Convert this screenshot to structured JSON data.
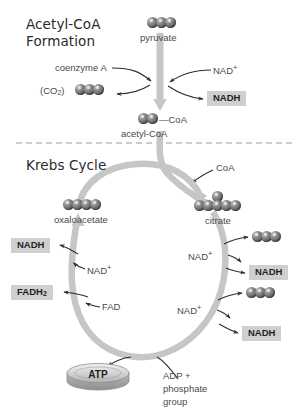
{
  "diagram": {
    "colors": {
      "arrow_gray": "#c4c4c4",
      "box_gray": "#cfcfcf",
      "sphere_gray": "#5e5e5e",
      "text_gray": "#4a4a4a",
      "heading_dark": "#2b2b2b",
      "divider_gray": "#9a9a9a",
      "background": "#ffffff"
    }
  },
  "sections": {
    "top": {
      "heading_line1": "Acetyl-CoA",
      "heading_line2": "Formation"
    },
    "bottom": {
      "heading": "Krebs Cycle"
    }
  },
  "acetyl_coa_formation": {
    "pyruvate": {
      "label": "pyruvate",
      "carbons": 3
    },
    "coenzyme_a": {
      "label": "coenzyme A"
    },
    "nad_plus": {
      "label": "NAD",
      "superscript": "+"
    },
    "nadh": {
      "label": "NADH"
    },
    "co2": {
      "label": "(CO",
      "subscript": "2",
      "label_end": ")",
      "carbons": 3
    },
    "acetyl_coa": {
      "label": "acetyl-CoA",
      "carbons": 2,
      "bond": "—",
      "coa_tag": "CoA"
    }
  },
  "krebs_cycle": {
    "coa_released": {
      "label": "CoA"
    },
    "oxaloacetate": {
      "label": "oxaloacetate",
      "carbons": 4
    },
    "citrate": {
      "label": "citrate",
      "carbons": 6
    },
    "left_reactions": [
      {
        "reactant": "NAD",
        "reactant_sup": "+",
        "product": "NADH"
      },
      {
        "reactant": "FAD",
        "reactant_sup": "",
        "product": "FADH",
        "product_sub": "2"
      }
    ],
    "right_reactions": [
      {
        "reactant": "NAD",
        "reactant_sup": "+",
        "product": "NADH",
        "co2_carbons": 3
      },
      {
        "reactant": "NAD",
        "reactant_sup": "+",
        "product": "NADH",
        "co2_carbons": 3
      }
    ],
    "atp": {
      "label": "ATP"
    },
    "adp": {
      "line1": "ADP +",
      "line2": "phosphate",
      "line3": "group"
    }
  }
}
